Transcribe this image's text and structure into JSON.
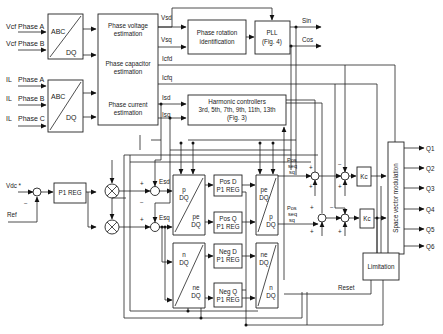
{
  "inputs": {
    "vcf_a": {
      "signal": "Vcf",
      "phase": "Phase A"
    },
    "vcf_b": {
      "signal": "Vcf",
      "phase": "Phase B"
    },
    "il_a": {
      "signal": "IL",
      "phase": "Phase A"
    },
    "il_b": {
      "signal": "IL",
      "phase": "Phase B"
    },
    "il_c": {
      "signal": "IL",
      "phase": "Phase C"
    },
    "vdc": "Vdc *",
    "ref": "Ref"
  },
  "blocks": {
    "abc_dq_1": {
      "top": "ABC",
      "bottom": "DQ"
    },
    "abc_dq_2": {
      "top": "ABC",
      "bottom": "DQ"
    },
    "estimation": {
      "voltage": [
        "Phase voltage",
        "estimation"
      ],
      "capacitor": [
        "Phase capacitor",
        "estimation"
      ],
      "current": [
        "Phase current",
        "estimation"
      ]
    },
    "phase_rotation": [
      "Phase rotation",
      "identification"
    ],
    "pll": [
      "PLL",
      "(Fig. 4)"
    ],
    "harmonic": [
      "Harmonic controllers",
      "3rd, 5th, 7th, 9th, 11th, 13th",
      "(Fig. 3)"
    ],
    "p1_reg": "P1 REG",
    "p_dq": {
      "top": "p",
      "top2": "DQ",
      "bottom": "pe",
      "bottom2": "DQ"
    },
    "pe_dq": {
      "top": "pe",
      "top2": "DQ",
      "bottom": "p",
      "bottom2": "DQ"
    },
    "n_dq": {
      "top": "n",
      "top2": "DQ",
      "bottom": "ne",
      "bottom2": "DQ"
    },
    "ne_dq": {
      "top": "ne",
      "top2": "DQ",
      "bottom": "n",
      "bottom2": "DQ"
    },
    "pos_d": [
      "Pos D",
      "P1 REG"
    ],
    "pos_q": [
      "Pos Q",
      "P1 REG"
    ],
    "neg_d": [
      "Neg D",
      "P1 REG"
    ],
    "neg_q": [
      "Neg Q",
      "P1 REG"
    ],
    "kc1": "Kc",
    "kc2": "Kc",
    "svm": "Space vector modulation",
    "limitation": "Limitation"
  },
  "signals": {
    "vsd": "Vsd",
    "vsq": "Vsq",
    "icfd": "Icfd",
    "icfq": "Icfq",
    "isd": "Isd",
    "isq": "Isq",
    "sin": "Sin",
    "cos": "Cos",
    "esd": "Esd",
    "esq": "Esq",
    "pos_seq_sq_1": [
      "Pos",
      "seq",
      "sq"
    ],
    "pos_seq_sq_2": [
      "Pos",
      "seq",
      "sq"
    ],
    "reset": "Reset"
  },
  "signs": {
    "plus": "+",
    "minus": "−"
  },
  "outputs": [
    "Q1",
    "Q2",
    "Q3",
    "Q4",
    "Q5",
    "Q6"
  ]
}
